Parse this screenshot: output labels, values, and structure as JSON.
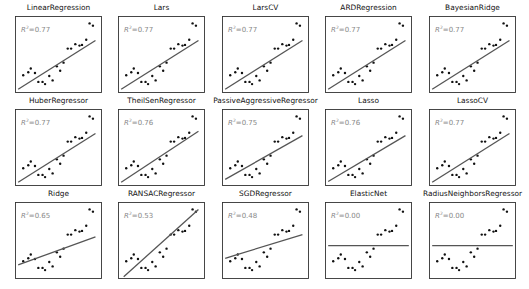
{
  "chart_data": {
    "type": "scatter",
    "title": "",
    "layout": {
      "rows": 3,
      "cols": 5,
      "grid": false,
      "axes_ticks": false,
      "legend": false
    },
    "points": [
      [
        0.08,
        0.22
      ],
      [
        0.14,
        0.26
      ],
      [
        0.17,
        0.31
      ],
      [
        0.22,
        0.25
      ],
      [
        0.26,
        0.13
      ],
      [
        0.31,
        0.13
      ],
      [
        0.34,
        0.1
      ],
      [
        0.39,
        0.21
      ],
      [
        0.43,
        0.15
      ],
      [
        0.48,
        0.34
      ],
      [
        0.52,
        0.28
      ],
      [
        0.56,
        0.39
      ],
      [
        0.61,
        0.58
      ],
      [
        0.65,
        0.58
      ],
      [
        0.7,
        0.64
      ],
      [
        0.75,
        0.62
      ],
      [
        0.78,
        0.63
      ],
      [
        0.83,
        0.7
      ],
      [
        0.87,
        0.92
      ],
      [
        0.91,
        0.89
      ]
    ],
    "panels": [
      {
        "name": "LinearRegression",
        "r2": "0.77",
        "line": [
          [
            0.02,
            0.03
          ],
          [
            0.94,
            0.69
          ]
        ]
      },
      {
        "name": "Lars",
        "r2": "0.77",
        "line": [
          [
            0.02,
            0.03
          ],
          [
            0.94,
            0.69
          ]
        ]
      },
      {
        "name": "LarsCV",
        "r2": "0.77",
        "line": [
          [
            0.02,
            0.03
          ],
          [
            0.94,
            0.69
          ]
        ]
      },
      {
        "name": "ARDRegression",
        "r2": "0.77",
        "line": [
          [
            0.02,
            0.03
          ],
          [
            0.94,
            0.69
          ]
        ]
      },
      {
        "name": "BayesianRidge",
        "r2": "0.77",
        "line": [
          [
            0.02,
            0.03
          ],
          [
            0.94,
            0.69
          ]
        ]
      },
      {
        "name": "HuberRegressor",
        "r2": "0.77",
        "line": [
          [
            0.02,
            0.03
          ],
          [
            0.94,
            0.69
          ]
        ]
      },
      {
        "name": "TheilSenRegressor",
        "r2": "0.76",
        "line": [
          [
            0.02,
            0.03
          ],
          [
            0.94,
            0.72
          ]
        ]
      },
      {
        "name": "PassiveAggressiveRegressor",
        "r2": "0.75",
        "line": [
          [
            0.02,
            0.07
          ],
          [
            0.94,
            0.66
          ]
        ]
      },
      {
        "name": "Lasso",
        "r2": "0.76",
        "line": [
          [
            0.02,
            0.04
          ],
          [
            0.94,
            0.66
          ]
        ]
      },
      {
        "name": "LassoCV",
        "r2": "0.77",
        "line": [
          [
            0.02,
            0.03
          ],
          [
            0.94,
            0.69
          ]
        ]
      },
      {
        "name": "Ridge",
        "r2": "0.65",
        "line": [
          [
            0.02,
            0.17
          ],
          [
            0.94,
            0.55
          ]
        ]
      },
      {
        "name": "RANSACRegressor",
        "r2": "0.53",
        "line": [
          [
            0.05,
            0.01
          ],
          [
            0.94,
            0.92
          ]
        ]
      },
      {
        "name": "SGDRegressor",
        "r2": "0.48",
        "line": [
          [
            0.02,
            0.26
          ],
          [
            0.94,
            0.58
          ]
        ]
      },
      {
        "name": "ElasticNet",
        "r2": "0.00",
        "line": [
          [
            0.02,
            0.43
          ],
          [
            0.98,
            0.43
          ]
        ]
      },
      {
        "name": "RadiusNeighborsRegressor",
        "r2": "0.00",
        "line": [
          [
            0.02,
            0.43
          ],
          [
            0.98,
            0.43
          ]
        ]
      }
    ],
    "xlabel": "",
    "ylabel": "",
    "xlim": [
      0,
      1
    ],
    "ylim": [
      0,
      1
    ]
  },
  "labels": {
    "r2_prefix": "R",
    "r2_sup": "2",
    "r2_eq": "="
  },
  "colors": {
    "points": "#111111",
    "line": "#555555",
    "frame": "#333333",
    "annotation": "#888888"
  }
}
